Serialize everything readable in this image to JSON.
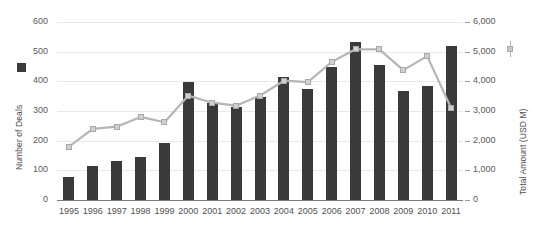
{
  "chart_data": {
    "type": "bar",
    "title": "",
    "xlabel": "",
    "categories": [
      "1995",
      "1996",
      "1997",
      "1998",
      "1999",
      "2000",
      "2001",
      "2002",
      "2003",
      "2004",
      "2005",
      "2006",
      "2007",
      "2008",
      "2009",
      "2010",
      "2011"
    ],
    "series": [
      {
        "name": "Number of Deals",
        "type": "bar",
        "axis": "left",
        "color": "#3a3a3a",
        "values": [
          78,
          113,
          130,
          145,
          193,
          398,
          327,
          313,
          348,
          415,
          375,
          450,
          532,
          455,
          368,
          385,
          520
        ]
      },
      {
        "name": "Total Amount (USD M)",
        "type": "line",
        "axis": "right",
        "color": "#b5b5b5",
        "marker_color": "#cfcfcf",
        "values": [
          1800,
          2400,
          2470,
          2800,
          2620,
          3520,
          3280,
          3180,
          3520,
          4020,
          3970,
          4650,
          5080,
          5080,
          4380,
          4850,
          3100
        ]
      }
    ],
    "axes": {
      "left": {
        "label": "Number of Deals",
        "min": 0,
        "max": 600,
        "step": 100,
        "ticks": [
          "0",
          "100",
          "200",
          "300",
          "400",
          "500",
          "600"
        ]
      },
      "right": {
        "label": "Total Amount (USD M)",
        "min": 0,
        "max": 6000,
        "step": 1000,
        "ticks": [
          "0",
          "1,000",
          "2,000",
          "3,000",
          "4,000",
          "5,000",
          "6,000"
        ]
      }
    },
    "grid": true,
    "legend_position": "axis-adjacent",
    "legend": [
      {
        "label": "Number of Deals",
        "marker": "square",
        "color": "#3b3b3b"
      },
      {
        "label": "Total Amount (USD M)",
        "marker": "line-square",
        "color": "#b5b5b5"
      }
    ]
  }
}
